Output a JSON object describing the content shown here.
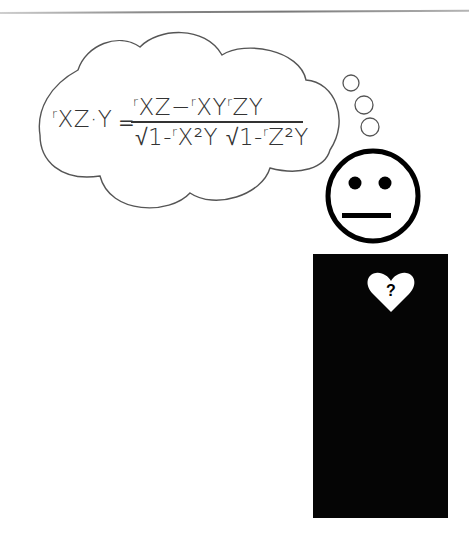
{
  "scene": {
    "description": "Cartoon figure thinking about a partial correlation formula",
    "formula": {
      "lhs_sub": "r",
      "lhs_main": "XZ·Y",
      "equals": "=",
      "numerator": {
        "t1_r": "r",
        "t1": "XZ",
        "minus": "−",
        "t2_r": "r",
        "t2": "XY",
        "t3_r": "r",
        "t3": "ZY"
      },
      "denominator": {
        "root1_pre": "√1-",
        "root1_r": "r",
        "root1": "X²Y",
        "root2_pre": " √1-",
        "root2_r": "r",
        "root2": "Z²Y"
      }
    },
    "face_expression": "neutral",
    "heart_label": "?",
    "colors": {
      "ink": "#000000",
      "line": "#333333",
      "background": "#ffffff",
      "heart": "#ffffff"
    }
  }
}
